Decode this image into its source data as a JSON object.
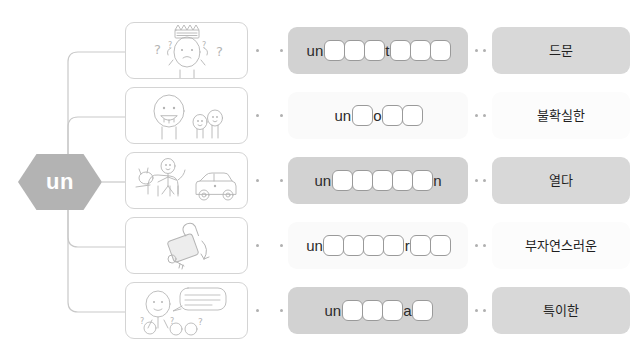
{
  "root": {
    "label": "un",
    "shape": "hexagon",
    "color": "#b3b3b3"
  },
  "colors": {
    "node_fill": "#b3b3b3",
    "card_border": "#d4d4d4",
    "shaded_card": "#d2d2d2",
    "plain_card": "#fafafa",
    "meaning_shaded": "#d8d8d8",
    "blank_border": "#9a9a9a",
    "connector": "#c9c9c9",
    "dot": "#b0b0b0",
    "text": "#1f1f1f"
  },
  "rows": [
    {
      "picture": {
        "name": "confused-person-with-crown-illustration",
        "description": "person with question marks and crown above head"
      },
      "word": {
        "background": "shaded",
        "segments": [
          {
            "type": "letters",
            "value": "un"
          },
          {
            "type": "blanks",
            "count": 3
          },
          {
            "type": "letters",
            "value": "t"
          },
          {
            "type": "blanks",
            "count": 3
          }
        ]
      },
      "meaning": {
        "background": "shaded",
        "text": "드문"
      }
    },
    {
      "picture": {
        "name": "one-large-two-small-figures-illustration",
        "description": "one big smiling figure beside two small figures"
      },
      "word": {
        "background": "plain",
        "segments": [
          {
            "type": "letters",
            "value": "un"
          },
          {
            "type": "blanks",
            "count": 1
          },
          {
            "type": "letters",
            "value": "o"
          },
          {
            "type": "blanks",
            "count": 2
          }
        ]
      },
      "meaning": {
        "background": "plain",
        "text": "불확실한"
      }
    },
    {
      "picture": {
        "name": "person-riding-horse-beside-car-illustration",
        "description": "person riding a horse next to a parked car"
      },
      "word": {
        "background": "shaded",
        "segments": [
          {
            "type": "letters",
            "value": "un"
          },
          {
            "type": "blanks",
            "count": 5
          },
          {
            "type": "letters",
            "value": "n"
          }
        ]
      },
      "meaning": {
        "background": "shaded",
        "text": "열다"
      }
    },
    {
      "picture": {
        "name": "open-padlock-with-key-illustration",
        "description": "open padlock with key and curved arrow"
      },
      "word": {
        "background": "plain",
        "segments": [
          {
            "type": "letters",
            "value": "un"
          },
          {
            "type": "blanks",
            "count": 4
          },
          {
            "type": "letters",
            "value": "r"
          },
          {
            "type": "blanks",
            "count": 2
          }
        ]
      },
      "meaning": {
        "background": "plain",
        "text": "부자연스러운"
      }
    },
    {
      "picture": {
        "name": "person-with-unusual-name-speech-bubble-illustration",
        "description": "person introducing themselves with a strange name while listeners look puzzled",
        "speech_bubble": "My name is MSTAKZMO TREMAMMY"
      },
      "word": {
        "background": "shaded",
        "segments": [
          {
            "type": "letters",
            "value": "un"
          },
          {
            "type": "blanks",
            "count": 3
          },
          {
            "type": "letters",
            "value": "a"
          },
          {
            "type": "blanks",
            "count": 1
          }
        ]
      },
      "meaning": {
        "background": "shaded",
        "text": "특이한"
      }
    }
  ]
}
